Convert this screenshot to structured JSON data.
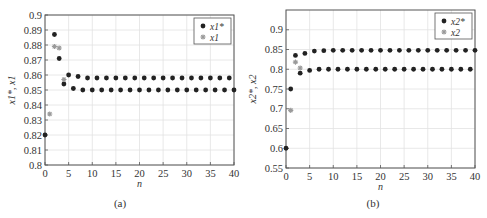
{
  "figure": {
    "panels": [
      "(a)",
      "(b)"
    ]
  },
  "colors": {
    "series_star": "#222222",
    "series_obs": "#9a9a9a",
    "axis": "#555555",
    "grid": "#e2e2e2"
  },
  "chart_data": [
    {
      "type": "scatter",
      "panel_label": "(a)",
      "title": "",
      "xlabel": "n",
      "ylabel": "x1*, x1",
      "xlim": [
        0,
        40
      ],
      "ylim": [
        0.8,
        0.9
      ],
      "xticks": [
        0,
        5,
        10,
        15,
        20,
        25,
        30,
        35,
        40
      ],
      "xtick_labels": [
        "0",
        "5",
        "10",
        "15",
        "20",
        "25",
        "30",
        "35",
        "40"
      ],
      "yticks": [
        0.8,
        0.81,
        0.82,
        0.83,
        0.84,
        0.85,
        0.86,
        0.87,
        0.88,
        0.89,
        0.9
      ],
      "ytick_labels": [
        "0.8",
        "0.81",
        "0.82",
        "0.83",
        "0.84",
        "0.85",
        "0.86",
        "0.87",
        "0.88",
        "0.89",
        "0.9"
      ],
      "grid": true,
      "legend_position": "upper right",
      "legend": [
        "x1*",
        "x1"
      ],
      "series": [
        {
          "name": "x1*",
          "marker": "dot",
          "points": [
            [
              0,
              0.82
            ],
            [
              2,
              0.887
            ],
            [
              3,
              0.871
            ],
            [
              4,
              0.854
            ],
            [
              5,
              0.86
            ],
            [
              6,
              0.851
            ],
            [
              7,
              0.859
            ],
            [
              8,
              0.85
            ],
            [
              9,
              0.858
            ],
            [
              10,
              0.85
            ],
            [
              11,
              0.858
            ],
            [
              12,
              0.85
            ],
            [
              13,
              0.858
            ],
            [
              14,
              0.85
            ],
            [
              15,
              0.858
            ],
            [
              16,
              0.85
            ],
            [
              17,
              0.858
            ],
            [
              18,
              0.85
            ],
            [
              19,
              0.858
            ],
            [
              20,
              0.85
            ],
            [
              21,
              0.858
            ],
            [
              22,
              0.85
            ],
            [
              23,
              0.858
            ],
            [
              24,
              0.85
            ],
            [
              25,
              0.858
            ],
            [
              26,
              0.85
            ],
            [
              27,
              0.858
            ],
            [
              28,
              0.85
            ],
            [
              29,
              0.858
            ],
            [
              30,
              0.85
            ],
            [
              31,
              0.858
            ],
            [
              32,
              0.85
            ],
            [
              33,
              0.858
            ],
            [
              34,
              0.85
            ],
            [
              35,
              0.858
            ],
            [
              36,
              0.85
            ],
            [
              37,
              0.858
            ],
            [
              38,
              0.85
            ],
            [
              39,
              0.858
            ],
            [
              40,
              0.85
            ]
          ]
        },
        {
          "name": "x1",
          "marker": "star",
          "points": [
            [
              1,
              0.834
            ],
            [
              2,
              0.879
            ],
            [
              3,
              0.878
            ],
            [
              4,
              0.857
            ]
          ]
        }
      ]
    },
    {
      "type": "scatter",
      "panel_label": "(b)",
      "title": "",
      "xlabel": "n",
      "ylabel": "x2*, x2",
      "xlim": [
        0,
        40
      ],
      "ylim": [
        0.55,
        0.95
      ],
      "xticks": [
        0,
        5,
        10,
        15,
        20,
        25,
        30,
        35,
        40
      ],
      "xtick_labels": [
        "0",
        "5",
        "10",
        "15",
        "20",
        "25",
        "30",
        "35",
        "40"
      ],
      "yticks": [
        0.55,
        0.6,
        0.65,
        0.7,
        0.75,
        0.8,
        0.85,
        0.9
      ],
      "ytick_labels": [
        "0.55",
        "0.6",
        "0.65",
        "0.7",
        "0.75",
        "0.8",
        "0.85",
        "0.9"
      ],
      "grid": true,
      "legend_position": "upper right",
      "legend": [
        "x2*",
        "x2"
      ],
      "series": [
        {
          "name": "x2*",
          "marker": "dot",
          "points": [
            [
              0,
              0.6
            ],
            [
              1,
              0.75
            ],
            [
              2,
              0.835
            ],
            [
              3,
              0.79
            ],
            [
              4,
              0.84
            ],
            [
              5,
              0.797
            ],
            [
              6,
              0.846
            ],
            [
              7,
              0.8
            ],
            [
              8,
              0.847
            ],
            [
              9,
              0.8
            ],
            [
              10,
              0.848
            ],
            [
              11,
              0.8
            ],
            [
              12,
              0.848
            ],
            [
              13,
              0.8
            ],
            [
              14,
              0.848
            ],
            [
              15,
              0.8
            ],
            [
              16,
              0.848
            ],
            [
              17,
              0.8
            ],
            [
              18,
              0.848
            ],
            [
              19,
              0.8
            ],
            [
              20,
              0.848
            ],
            [
              21,
              0.8
            ],
            [
              22,
              0.848
            ],
            [
              23,
              0.8
            ],
            [
              24,
              0.848
            ],
            [
              25,
              0.8
            ],
            [
              26,
              0.848
            ],
            [
              27,
              0.8
            ],
            [
              28,
              0.848
            ],
            [
              29,
              0.8
            ],
            [
              30,
              0.848
            ],
            [
              31,
              0.8
            ],
            [
              32,
              0.848
            ],
            [
              33,
              0.8
            ],
            [
              34,
              0.848
            ],
            [
              35,
              0.8
            ],
            [
              36,
              0.848
            ],
            [
              37,
              0.8
            ],
            [
              38,
              0.848
            ],
            [
              39,
              0.8
            ],
            [
              40,
              0.848
            ]
          ]
        },
        {
          "name": "x2",
          "marker": "star",
          "points": [
            [
              1,
              0.696
            ],
            [
              2,
              0.818
            ],
            [
              3,
              0.803
            ]
          ]
        }
      ]
    }
  ]
}
